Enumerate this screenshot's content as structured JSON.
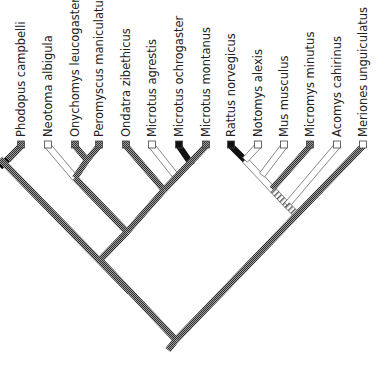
{
  "tree": {
    "type": "cladogram",
    "orientation": "tips-up",
    "legend": {
      "states": [
        {
          "name": "checkered",
          "fill": "pattern-checker"
        },
        {
          "name": "open",
          "fill": "#ffffff"
        },
        {
          "name": "black",
          "fill": "#111111"
        },
        {
          "name": "hatched",
          "fill": "pattern-hatch"
        }
      ]
    },
    "taxa": [
      {
        "label": "Phodopus campbelli",
        "x": 21,
        "state": "checkered"
      },
      {
        "label": "Neotoma albigula",
        "x": 48,
        "state": "open"
      },
      {
        "label": "Onychomys leucogaster",
        "x": 75,
        "state": "checkered"
      },
      {
        "label": "Peromyscus maniculatus",
        "x": 99,
        "state": "checkered"
      },
      {
        "label": "Ondatra zibethicus",
        "x": 126,
        "state": "checkered"
      },
      {
        "label": "Microtus agrestis",
        "x": 152,
        "state": "open"
      },
      {
        "label": "Microtus ochrogaster",
        "x": 179,
        "state": "black"
      },
      {
        "label": "Microtus montanus",
        "x": 206,
        "state": "checkered"
      },
      {
        "label": "Rattus norvegicus",
        "x": 231,
        "state": "black"
      },
      {
        "label": "Notomys alexis",
        "x": 258,
        "state": "open"
      },
      {
        "label": "Mus musculus",
        "x": 284,
        "state": "open"
      },
      {
        "label": "Micromys minutus",
        "x": 310,
        "state": "checkered"
      },
      {
        "label": "Acomys cahirinus",
        "x": 337,
        "state": "open"
      },
      {
        "label": "Meriones unguiculatus",
        "x": 363,
        "state": "open"
      }
    ],
    "branches": [
      {
        "from": [
          21,
          146
        ],
        "to": [
          8,
          159
        ],
        "state": "black"
      },
      {
        "from": [
          8,
          159
        ],
        "to": [
          0,
          167
        ],
        "state": "black"
      },
      {
        "from": [
          0,
          159
        ],
        "to": [
          130,
          292
        ],
        "state": "checkered"
      },
      {
        "from": [
          21,
          146
        ],
        "to": [
          8,
          160
        ],
        "state": "checkered"
      },
      {
        "from": [
          48,
          146
        ],
        "to": [
          75,
          178
        ],
        "state": "open"
      },
      {
        "from": [
          75,
          146
        ],
        "to": [
          87,
          160
        ],
        "state": "checkered"
      },
      {
        "from": [
          99,
          146
        ],
        "to": [
          87,
          160
        ],
        "state": "checkered"
      },
      {
        "from": [
          87,
          160
        ],
        "to": [
          75,
          178
        ],
        "state": "checkered"
      },
      {
        "from": [
          75,
          178
        ],
        "to": [
          127,
          232
        ],
        "state": "checkered"
      },
      {
        "from": [
          126,
          146
        ],
        "to": [
          164,
          190
        ],
        "state": "checkered"
      },
      {
        "from": [
          152,
          146
        ],
        "to": [
          175,
          175
        ],
        "state": "open"
      },
      {
        "from": [
          179,
          146
        ],
        "to": [
          192,
          165
        ],
        "state": "black"
      },
      {
        "from": [
          206,
          146
        ],
        "to": [
          164,
          190
        ],
        "state": "checkered"
      },
      {
        "from": [
          164,
          190
        ],
        "to": [
          127,
          232
        ],
        "state": "checkered"
      },
      {
        "from": [
          127,
          232
        ],
        "to": [
          100,
          260
        ],
        "state": "checkered"
      },
      {
        "from": [
          231,
          146
        ],
        "to": [
          245,
          160
        ],
        "state": "black"
      },
      {
        "from": [
          245,
          160
        ],
        "to": [
          273,
          190
        ],
        "state": "open"
      },
      {
        "from": [
          258,
          146
        ],
        "to": [
          245,
          160
        ],
        "state": "open"
      },
      {
        "from": [
          284,
          146
        ],
        "to": [
          262,
          175
        ],
        "state": "open"
      },
      {
        "from": [
          310,
          146
        ],
        "to": [
          272,
          189
        ],
        "state": "checkered"
      },
      {
        "from": [
          273,
          190
        ],
        "to": [
          287,
          205
        ],
        "state": "hatched"
      },
      {
        "from": [
          337,
          146
        ],
        "to": [
          287,
          205
        ],
        "state": "open"
      },
      {
        "from": [
          287,
          205
        ],
        "to": [
          295,
          213
        ],
        "state": "hatched"
      },
      {
        "from": [
          363,
          146
        ],
        "to": [
          176,
          340
        ],
        "state": "checkered"
      },
      {
        "from": [
          100,
          260
        ],
        "to": [
          176,
          340
        ],
        "state": "checkered"
      },
      {
        "from": [
          176,
          340
        ],
        "to": [
          168,
          350
        ],
        "state": "checkered"
      }
    ]
  }
}
